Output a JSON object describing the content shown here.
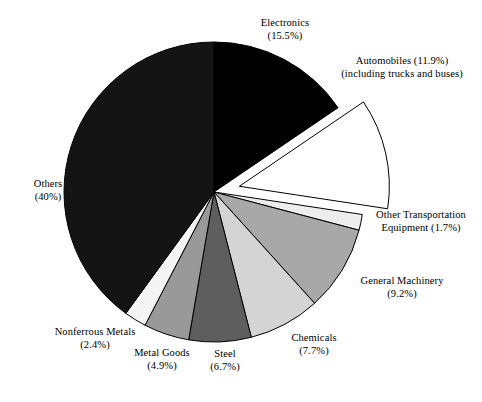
{
  "chart_data": {
    "type": "pie",
    "title": "",
    "subtitle": "",
    "xlabel": "",
    "ylabel": "",
    "legend_position": "none",
    "grid": false,
    "start_angle_deg": 0,
    "direction": "clockwise",
    "units": "percent",
    "categories": [
      "Electronics",
      "Automobiles",
      "Other Transportation Equipment",
      "General Machinery",
      "Chemicals",
      "Steel",
      "Metal Goods",
      "Nonferrous Metals",
      "Others"
    ],
    "values": [
      15.5,
      11.9,
      1.7,
      9.2,
      7.7,
      6.7,
      4.9,
      2.4,
      40
    ],
    "slices": [
      {
        "name": "Electronics",
        "label_line1": "Electronics",
        "label_line2": "(15.5%)",
        "value": 15.5,
        "value_text": "15.5%",
        "fill": "#000000",
        "stroke": "#000000",
        "exploded": false
      },
      {
        "name": "Automobiles",
        "label_line1": "Automobiles (11.9%)",
        "label_line2": "(including trucks and buses)",
        "value": 11.9,
        "value_text": "11.9%",
        "note": "including trucks and buses",
        "fill": "#ffffff",
        "stroke": "#000000",
        "exploded": true
      },
      {
        "name": "Other Transportation Equipment",
        "label_line1": "Other Transportation",
        "label_line2": "Equipment (1.7%)",
        "value": 1.7,
        "value_text": "1.7%",
        "fill": "#ededed",
        "stroke": "#000000",
        "exploded": false
      },
      {
        "name": "General Machinery",
        "label_line1": "General Machinery",
        "label_line2": "(9.2%)",
        "value": 9.2,
        "value_text": "9.2%",
        "fill": "#a8a8a8",
        "stroke": "#000000",
        "exploded": false
      },
      {
        "name": "Chemicals",
        "label_line1": "Chemicals",
        "label_line2": "(7.7%)",
        "value": 7.7,
        "value_text": "7.7%",
        "fill": "#d4d4d4",
        "stroke": "#000000",
        "exploded": false
      },
      {
        "name": "Steel",
        "label_line1": "Steel",
        "label_line2": "(6.7%)",
        "value": 6.7,
        "value_text": "6.7%",
        "fill": "#5e5e5e",
        "stroke": "#000000",
        "exploded": false
      },
      {
        "name": "Metal Goods",
        "label_line1": "Metal Goods",
        "label_line2": "(4.9%)",
        "value": 4.9,
        "value_text": "4.9%",
        "fill": "#999999",
        "stroke": "#000000",
        "exploded": false
      },
      {
        "name": "Nonferrous Metals",
        "label_line1": "Nonferrous Metals",
        "label_line2": "(2.4%)",
        "value": 2.4,
        "value_text": "2.4%",
        "fill": "#f4f4f4",
        "stroke": "#000000",
        "exploded": false
      },
      {
        "name": "Others",
        "label_line1": "Others",
        "label_line2": "(40%)",
        "value": 40,
        "value_text": "40%",
        "fill": "#141414",
        "stroke": "#000000",
        "exploded": false
      }
    ],
    "geometry": {
      "center_x": 214,
      "center_y": 192,
      "radius": 150,
      "explode_offset": 26
    }
  }
}
